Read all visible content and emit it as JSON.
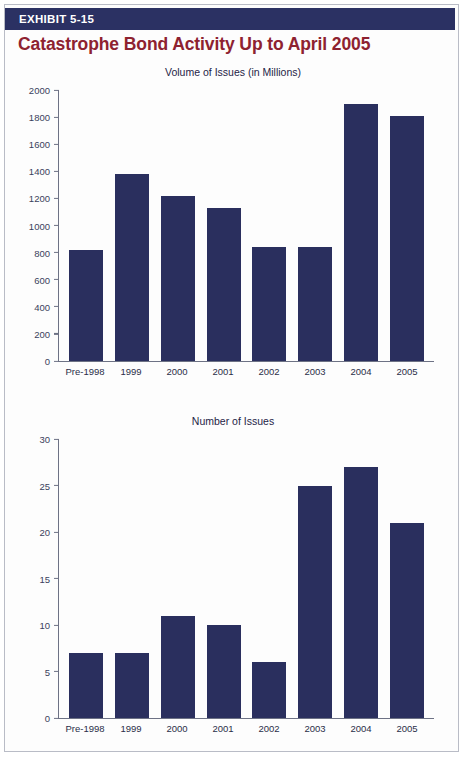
{
  "exhibit": {
    "banner_label": "EXHIBIT 5-15",
    "title": "Catastrophe Bond Activity Up to April 2005",
    "banner_color": "#2b3163",
    "title_color": "#8e2230",
    "bar_color": "#2a2f5e"
  },
  "chart_data": [
    {
      "type": "bar",
      "title": "Volume of Issues (in Millions)",
      "xlabel": "",
      "ylabel": "",
      "categories": [
        "Pre-1998",
        "1999",
        "2000",
        "2001",
        "2002",
        "2003",
        "2004",
        "2005"
      ],
      "values": [
        820,
        1380,
        1220,
        1130,
        840,
        840,
        1900,
        1810
      ],
      "ylim": [
        0,
        2000
      ],
      "yticks": [
        2000,
        1800,
        1600,
        1400,
        1200,
        1000,
        800,
        600,
        400,
        200,
        0
      ],
      "grid": false,
      "legend": null
    },
    {
      "type": "bar",
      "title": "Number of Issues",
      "xlabel": "",
      "ylabel": "",
      "categories": [
        "Pre-1998",
        "1999",
        "2000",
        "2001",
        "2002",
        "2003",
        "2004",
        "2005"
      ],
      "values": [
        7,
        7,
        11,
        10,
        6,
        25,
        27,
        21
      ],
      "ylim": [
        0,
        30
      ],
      "yticks": [
        30,
        25,
        20,
        15,
        10,
        5,
        0
      ],
      "grid": false,
      "legend": null
    }
  ]
}
